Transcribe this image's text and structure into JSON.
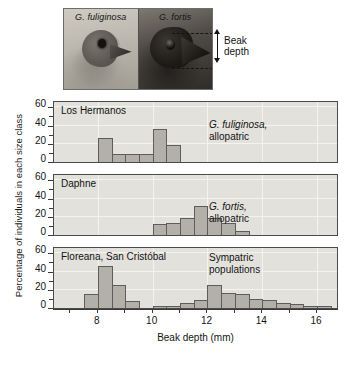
{
  "figure": {
    "photo_panel": {
      "left_caption": "G. fuliginosa",
      "right_caption": "G. fortis",
      "annotation_line1": "Beak",
      "annotation_line2": "depth",
      "left_icon": "finch-head-pale-icon",
      "right_icon": "finch-head-dark-icon",
      "arrow_icon": "double-headed-vertical-arrow-icon"
    },
    "axis": {
      "ylabel": "Percentage of individuals in each size class",
      "xlabel": "Beak depth (mm)",
      "yticks": [
        0,
        20,
        40,
        60
      ],
      "xticks": [
        7,
        8,
        9,
        10,
        11,
        12,
        13,
        14,
        15,
        16
      ],
      "xtick_labels": [
        "8",
        "10",
        "12",
        "14",
        "16"
      ],
      "xtick_label_values": [
        8,
        10,
        12,
        14,
        16
      ]
    },
    "panels": [
      {
        "title": "Los Hermanos",
        "note_species": "G. fuliginosa,",
        "note_status": "allopatric"
      },
      {
        "title": "Daphne",
        "note_species": "G. fortis,",
        "note_status": "allopatric"
      },
      {
        "title": "Floreana, San Cristóbal",
        "note_species": "Sympatric",
        "note_status": "populations"
      }
    ],
    "colors": {
      "panel_background": "#e3e1dc",
      "bar_fill": "#b3b0a9",
      "bar_stroke": "#5d5d5d",
      "axis": "#3a3a3a",
      "text": "#141414",
      "photo_background": "#b9b5ad"
    }
  },
  "chart_data": {
    "type": "bar",
    "xlabel": "Beak depth (mm)",
    "ylabel": "Percentage of individuals in each size class",
    "xlim": [
      6.4,
      16.8
    ],
    "ylim": [
      0,
      68
    ],
    "yticks": [
      0,
      20,
      40,
      60
    ],
    "xticks": [
      8,
      10,
      12,
      14,
      16
    ],
    "grid": true,
    "legend": "none",
    "bin_width": 0.5,
    "panels": [
      {
        "name": "Los Hermanos",
        "annotation": "G. fuliginosa, allopatric",
        "bins": [
          {
            "x0": 8.0,
            "x1": 8.5,
            "value": 26
          },
          {
            "x0": 8.5,
            "x1": 9.0,
            "value": 9
          },
          {
            "x0": 9.0,
            "x1": 9.5,
            "value": 9
          },
          {
            "x0": 9.5,
            "x1": 10.0,
            "value": 9
          },
          {
            "x0": 10.0,
            "x1": 10.5,
            "value": 36
          },
          {
            "x0": 10.5,
            "x1": 11.0,
            "value": 19
          }
        ]
      },
      {
        "name": "Daphne",
        "annotation": "G. fortis, allopatric",
        "bins": [
          {
            "x0": 10.0,
            "x1": 10.5,
            "value": 12
          },
          {
            "x0": 10.5,
            "x1": 11.0,
            "value": 13
          },
          {
            "x0": 11.0,
            "x1": 11.5,
            "value": 19
          },
          {
            "x0": 11.5,
            "x1": 12.0,
            "value": 32
          },
          {
            "x0": 12.0,
            "x1": 12.5,
            "value": 19
          },
          {
            "x0": 12.5,
            "x1": 13.0,
            "value": 13
          },
          {
            "x0": 13.0,
            "x1": 13.5,
            "value": 4
          }
        ]
      },
      {
        "name": "Floreana, San Cristóbal",
        "annotation": "Sympatric populations",
        "bins": [
          {
            "x0": 7.5,
            "x1": 8.0,
            "value": 15
          },
          {
            "x0": 8.0,
            "x1": 8.5,
            "value": 46
          },
          {
            "x0": 8.5,
            "x1": 9.0,
            "value": 25
          },
          {
            "x0": 9.0,
            "x1": 9.5,
            "value": 8
          },
          {
            "x0": 10.0,
            "x1": 10.5,
            "value": 2
          },
          {
            "x0": 10.5,
            "x1": 11.0,
            "value": 2
          },
          {
            "x0": 11.0,
            "x1": 11.5,
            "value": 6
          },
          {
            "x0": 11.5,
            "x1": 12.0,
            "value": 9
          },
          {
            "x0": 12.0,
            "x1": 12.5,
            "value": 25
          },
          {
            "x0": 12.5,
            "x1": 13.0,
            "value": 17
          },
          {
            "x0": 13.0,
            "x1": 13.5,
            "value": 15
          },
          {
            "x0": 13.5,
            "x1": 14.0,
            "value": 10
          },
          {
            "x0": 14.0,
            "x1": 14.5,
            "value": 9
          },
          {
            "x0": 14.5,
            "x1": 15.0,
            "value": 5
          },
          {
            "x0": 15.0,
            "x1": 15.5,
            "value": 4
          },
          {
            "x0": 15.5,
            "x1": 16.0,
            "value": 2
          },
          {
            "x0": 16.0,
            "x1": 16.5,
            "value": 2
          }
        ]
      }
    ]
  }
}
